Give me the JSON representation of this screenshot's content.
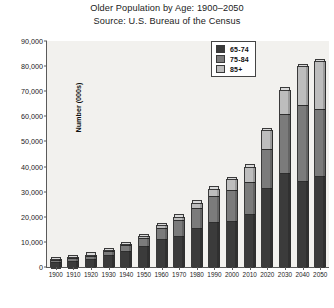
{
  "chart_data": {
    "type": "bar",
    "title": "Older Population by Age: 1900–2050",
    "subtitle": "Source: U.S. Bureau of the Census",
    "xlabel": "",
    "ylabel": "Number (000s)",
    "ylim": [
      0,
      90000
    ],
    "ytick_step": 10000,
    "ytick_labels": [
      "90,000",
      "80,000",
      "70,000",
      "60,000",
      "50,000",
      "40,000",
      "30,000",
      "20,000",
      "10,000",
      "0"
    ],
    "ytick_values": [
      90000,
      80000,
      70000,
      60000,
      50000,
      40000,
      30000,
      20000,
      10000,
      0
    ],
    "grid": false,
    "stacked": true,
    "legend_position": "top-right",
    "categories": [
      "1900",
      "1910",
      "1920",
      "1930",
      "1940",
      "1950",
      "1960",
      "1970",
      "1980",
      "1990",
      "2000",
      "2010",
      "2020",
      "2030",
      "2040",
      "2050"
    ],
    "series": [
      {
        "name": "65-74",
        "color": "#3b3b3b",
        "values": [
          2186,
          2793,
          3464,
          4721,
          6376,
          8415,
          10997,
          12447,
          15581,
          18107,
          18391,
          21057,
          31385,
          37407,
          34370,
          36407
        ]
      },
      {
        "name": "75-84",
        "color": "#7b7b7b",
        "values": [
          772,
          989,
          1259,
          1641,
          2278,
          3278,
          4633,
          6124,
          7729,
          10055,
          12361,
          12680,
          15743,
          23517,
          30134,
          26606
        ]
      },
      {
        "name": "85+",
        "color": "#bdbdbd",
        "values": [
          123,
          167,
          210,
          272,
          365,
          577,
          929,
          1409,
          2240,
          3080,
          4267,
          6123,
          7269,
          9603,
          15409,
          18903
        ]
      }
    ],
    "totals": [
      3081,
      3949,
      4933,
      6634,
      9019,
      12270,
      16559,
      19980,
      25550,
      31242,
      35019,
      39860,
      54397,
      70527,
      79913,
      81916
    ]
  },
  "legend": {
    "items": [
      {
        "label": "65-74",
        "color": "#3b3b3b"
      },
      {
        "label": "75-84",
        "color": "#7b7b7b"
      },
      {
        "label": "85+",
        "color": "#bdbdbd"
      }
    ]
  }
}
